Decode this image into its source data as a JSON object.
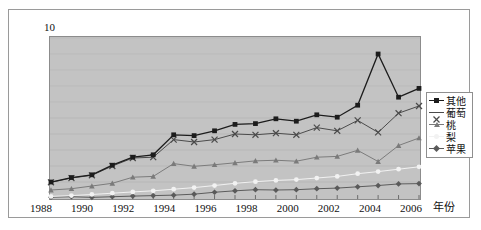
{
  "chart_data": {
    "type": "line",
    "title": "",
    "xlabel": "年份",
    "ylabel": "",
    "x": [
      1988,
      1989,
      1990,
      1991,
      1992,
      1993,
      1994,
      1995,
      1996,
      1997,
      1998,
      1999,
      2000,
      2001,
      2002,
      2003,
      2004,
      2005,
      2006
    ],
    "tick_labels_x": [
      "1988",
      "1990",
      "1992",
      "1994",
      "1996",
      "1998",
      "2000",
      "2002",
      "2004",
      "2006"
    ],
    "tick_labels_y": [
      "0",
      "1",
      "2",
      "3",
      "4",
      "5",
      "6",
      "7",
      "8",
      "9",
      "10"
    ],
    "xlim": [
      1988,
      2006
    ],
    "ylim": [
      0,
      10
    ],
    "grid": true,
    "legend_position": "right",
    "plot_background": "#c3c3c3",
    "series": [
      {
        "name": "其他",
        "color": "#1c1c1c",
        "marker": "square",
        "values": [
          1.0,
          1.28,
          1.45,
          2.05,
          2.55,
          2.7,
          3.95,
          3.9,
          4.2,
          4.6,
          4.65,
          4.95,
          4.8,
          5.2,
          5.05,
          5.8,
          9.0,
          6.3,
          6.85
        ]
      },
      {
        "name": "葡萄",
        "color": "#4a4a4a",
        "marker": "cross",
        "values": [
          0.98,
          1.25,
          1.42,
          2.0,
          2.5,
          2.55,
          3.65,
          3.5,
          3.65,
          4.0,
          3.95,
          4.05,
          3.95,
          4.4,
          4.2,
          4.85,
          4.1,
          5.3,
          5.75
        ]
      },
      {
        "name": "桃",
        "color": "#7a7a7a",
        "marker": "triangle",
        "values": [
          0.5,
          0.58,
          0.75,
          0.92,
          1.3,
          1.35,
          2.15,
          1.98,
          2.08,
          2.2,
          2.32,
          2.36,
          2.3,
          2.55,
          2.6,
          2.98,
          2.28,
          3.28,
          3.75
        ]
      },
      {
        "name": "梨",
        "color": "#f2f2f2",
        "marker": "circle",
        "values": [
          0.1,
          0.15,
          0.22,
          0.3,
          0.38,
          0.45,
          0.55,
          0.65,
          0.78,
          0.92,
          1.02,
          1.1,
          1.15,
          1.25,
          1.35,
          1.52,
          1.65,
          1.8,
          1.95
        ]
      },
      {
        "name": "苹果",
        "color": "#5a5a5a",
        "marker": "diamond",
        "values": [
          0.05,
          0.08,
          0.04,
          0.08,
          0.12,
          0.15,
          0.18,
          0.24,
          0.36,
          0.45,
          0.52,
          0.5,
          0.52,
          0.58,
          0.62,
          0.7,
          0.78,
          0.88,
          0.9
        ]
      }
    ]
  },
  "legend": {
    "items": [
      {
        "label": "其他"
      },
      {
        "label": "葡萄"
      },
      {
        "label": "桃"
      },
      {
        "label": "梨"
      },
      {
        "label": "苹果"
      }
    ]
  },
  "axis": {
    "x_title": "年份"
  }
}
